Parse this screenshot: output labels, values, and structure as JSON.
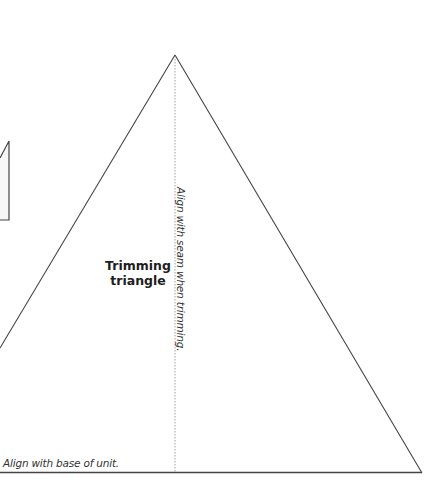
{
  "diagram": {
    "shape_label_line1": "Trimming",
    "shape_label_line2": "triangle",
    "seam_guide_label": "Align with seam when trimming.",
    "base_guide_label": "Align with base of unit.",
    "colors": {
      "outline": "#444444",
      "guide": "#888888",
      "partial_fill": "#f7f7f7"
    }
  }
}
